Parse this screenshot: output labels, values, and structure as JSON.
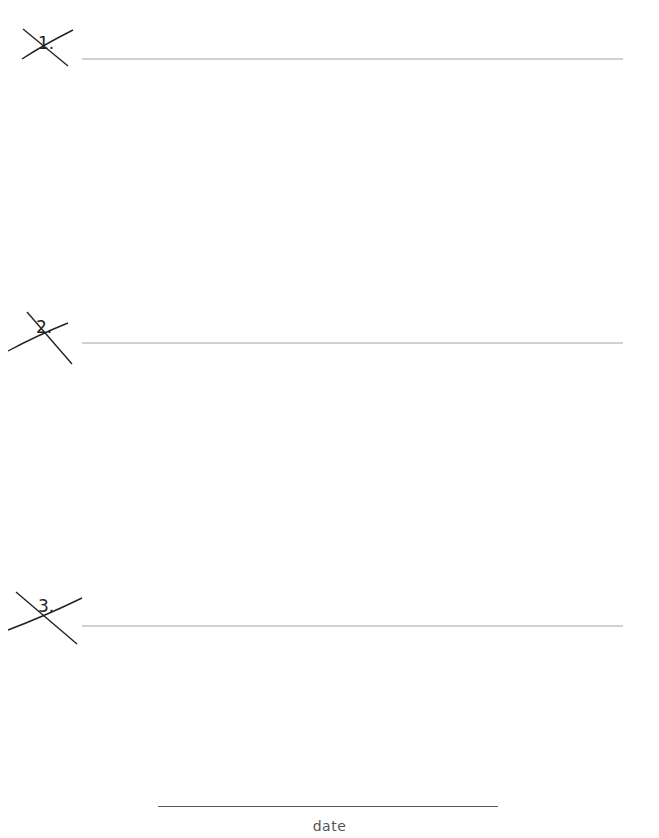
{
  "page": {
    "items": [
      {
        "number": "1.",
        "crossed_out": true
      },
      {
        "number": "2.",
        "crossed_out": true
      },
      {
        "number": "3.",
        "crossed_out": true
      }
    ],
    "date_label": "date"
  },
  "colors": {
    "rule": "#d2d2d2",
    "ink": "#222222",
    "date_text": "#555555"
  }
}
